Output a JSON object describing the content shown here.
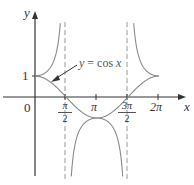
{
  "diagram": {
    "type": "function-graph",
    "curves": [
      {
        "name": "cos",
        "label": "y = cos x",
        "style": "solid"
      },
      {
        "name": "sec",
        "style": "solid",
        "branches": [
          "(-π/2, π/2)",
          "(π/2, 3π/2)",
          "(3π/2, 5π/2)"
        ]
      }
    ],
    "asymptotes": [
      "π/2",
      "3π/2"
    ],
    "colors": {
      "curve": "#8a8a8a",
      "axis": "#333333",
      "asymptote": "#9a9a9a",
      "text": "#333333"
    }
  },
  "axes": {
    "x_label": "x",
    "y_label": "y",
    "origin_label": "0",
    "y_tick_label": "1",
    "x_ticks": {
      "pi_over_2": {
        "num": "π",
        "den": "2"
      },
      "pi": "π",
      "three_pi_over_2": {
        "num": "3π",
        "den": "2"
      },
      "two_pi": "2π"
    }
  },
  "annotation": {
    "text_y": "y",
    "text_eq": " = cos ",
    "text_x": "x"
  }
}
